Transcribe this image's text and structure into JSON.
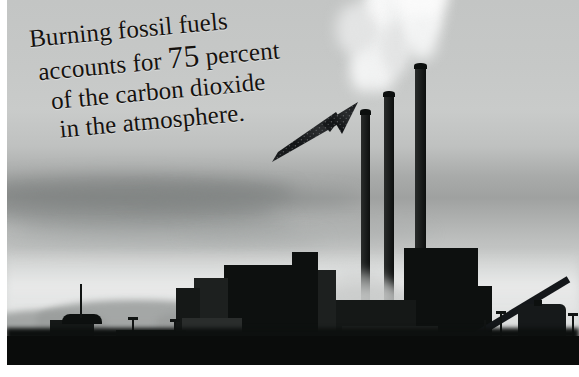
{
  "image": {
    "type": "photo-infographic",
    "subject": "coal-fired power plant with three smokestacks emitting smoke",
    "palette": {
      "sky_light": "#c9cbca",
      "sky_cloud": "#7c807f",
      "haze": "#d9dbda",
      "silhouette": "#0d100f",
      "smoke": "#f2f3f3",
      "text": "#15120f",
      "paper_border": "#ffffff"
    }
  },
  "caption": {
    "line1": "Burning fossil fuels",
    "line2_before": "accounts for ",
    "line2_number": "75",
    "line2_after": " percent",
    "line3": "of the carbon dioxide",
    "line4": "in the atmosphere.",
    "full_text": "Burning fossil fuels accounts for 75 percent of the carbon dioxide in the atmosphere.",
    "statistic_value": "75",
    "statistic_unit": "percent",
    "rotation_degrees": "-5.2"
  },
  "arrow": {
    "label": "arrow pointing to smokestacks",
    "direction": "up-right",
    "color": "#16181a"
  },
  "scene": {
    "smokestacks": [
      {
        "name": "smokestack-left",
        "top": 112,
        "left": 355,
        "width": 9
      },
      {
        "name": "smokestack-middle",
        "top": 94,
        "left": 378,
        "width": 10
      },
      {
        "name": "smokestack-right",
        "top": 66,
        "left": 409,
        "width": 11
      }
    ],
    "plant_label": "power-plant-building",
    "tank_label": "storage-tank",
    "horizon_label": "distant-hills"
  }
}
